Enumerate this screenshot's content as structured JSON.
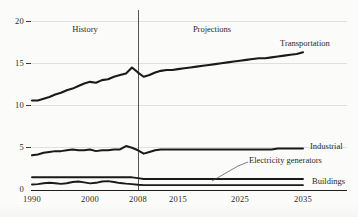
{
  "chart_data": {
    "type": "line",
    "title": "",
    "xlabel": "",
    "ylabel": "",
    "xlim": [
      1990,
      2035
    ],
    "ylim": [
      0,
      20
    ],
    "grid": true,
    "legend_position": "right-inline",
    "y_ticks": [
      "0",
      "5",
      "10",
      "15",
      "20"
    ],
    "y_tick_values": [
      0,
      5,
      10,
      15,
      20
    ],
    "x_ticks": [
      "1990",
      "2000",
      "2008",
      "2015",
      "2025",
      "2035"
    ],
    "x_tick_values": [
      1990,
      2000,
      2008,
      2015,
      2025,
      2035
    ],
    "annotations": [
      {
        "text": "History",
        "x": 1999,
        "y": 18.6
      },
      {
        "text": "Projections",
        "x": 2019,
        "y": 18.6
      }
    ],
    "divider": {
      "x": 2008,
      "label": "history-projection-divider"
    },
    "series": [
      {
        "name": "Transportation",
        "x": [
          1990,
          1991,
          1992,
          1993,
          1994,
          1995,
          1996,
          1997,
          1998,
          1999,
          2000,
          2001,
          2002,
          2003,
          2004,
          2005,
          2006,
          2007,
          2008,
          2009,
          2010,
          2011,
          2012,
          2013,
          2014,
          2015,
          2016,
          2017,
          2018,
          2019,
          2020,
          2021,
          2022,
          2023,
          2024,
          2025,
          2026,
          2027,
          2028,
          2029,
          2030,
          2031,
          2032,
          2033,
          2034,
          2035
        ],
        "values": [
          10.6,
          10.6,
          10.8,
          11.0,
          11.3,
          11.5,
          11.8,
          12.0,
          12.3,
          12.6,
          12.8,
          12.7,
          13.0,
          13.1,
          13.4,
          13.6,
          13.8,
          14.5,
          13.9,
          13.4,
          13.6,
          13.9,
          14.1,
          14.2,
          14.2,
          14.3,
          14.4,
          14.5,
          14.6,
          14.7,
          14.8,
          14.9,
          15.0,
          15.1,
          15.2,
          15.3,
          15.4,
          15.5,
          15.6,
          15.6,
          15.7,
          15.8,
          15.9,
          16.0,
          16.1,
          16.3
        ]
      },
      {
        "name": "Industrial",
        "x": [
          1990,
          1991,
          1992,
          1993,
          1994,
          1995,
          1996,
          1997,
          1998,
          1999,
          2000,
          2001,
          2002,
          2003,
          2004,
          2005,
          2006,
          2007,
          2008,
          2009,
          2010,
          2011,
          2012,
          2013,
          2014,
          2015,
          2016,
          2017,
          2018,
          2019,
          2020,
          2021,
          2022,
          2023,
          2024,
          2025,
          2026,
          2027,
          2028,
          2029,
          2030,
          2031,
          2032,
          2033,
          2034,
          2035
        ],
        "values": [
          4.1,
          4.2,
          4.4,
          4.5,
          4.6,
          4.6,
          4.7,
          4.8,
          4.7,
          4.7,
          4.8,
          4.6,
          4.7,
          4.7,
          4.8,
          4.8,
          5.2,
          5.0,
          4.7,
          4.3,
          4.5,
          4.7,
          4.8,
          4.8,
          4.8,
          4.8,
          4.8,
          4.8,
          4.8,
          4.8,
          4.8,
          4.8,
          4.8,
          4.8,
          4.8,
          4.8,
          4.8,
          4.8,
          4.8,
          4.8,
          4.8,
          4.9,
          4.9,
          4.9,
          4.9,
          4.9
        ]
      },
      {
        "name": "Electricity generators",
        "x": [
          1990,
          1991,
          1992,
          1993,
          1994,
          1995,
          1996,
          1997,
          1998,
          1999,
          2000,
          2001,
          2002,
          2003,
          2004,
          2005,
          2006,
          2007,
          2008,
          2009,
          2010,
          2011,
          2012,
          2013,
          2014,
          2015,
          2016,
          2017,
          2018,
          2019,
          2020,
          2021,
          2022,
          2023,
          2024,
          2025,
          2026,
          2027,
          2028,
          2029,
          2030,
          2031,
          2032,
          2033,
          2034,
          2035
        ],
        "values": [
          1.5,
          1.5,
          1.5,
          1.5,
          1.5,
          1.5,
          1.5,
          1.5,
          1.5,
          1.5,
          1.5,
          1.5,
          1.5,
          1.5,
          1.5,
          1.5,
          1.5,
          1.5,
          1.4,
          1.3,
          1.3,
          1.3,
          1.3,
          1.3,
          1.3,
          1.3,
          1.3,
          1.3,
          1.3,
          1.3,
          1.3,
          1.3,
          1.3,
          1.3,
          1.3,
          1.3,
          1.3,
          1.3,
          1.3,
          1.3,
          1.3,
          1.3,
          1.3,
          1.3,
          1.3,
          1.3
        ]
      },
      {
        "name": "Buildings",
        "x": [
          1990,
          1991,
          1992,
          1993,
          1994,
          1995,
          1996,
          1997,
          1998,
          1999,
          2000,
          2001,
          2002,
          2003,
          2004,
          2005,
          2006,
          2007,
          2008,
          2009,
          2010,
          2011,
          2012,
          2013,
          2014,
          2015,
          2016,
          2017,
          2018,
          2019,
          2020,
          2021,
          2022,
          2023,
          2024,
          2025,
          2026,
          2027,
          2028,
          2029,
          2030,
          2031,
          2032,
          2033,
          2034,
          2035
        ],
        "values": [
          0.65,
          0.7,
          0.8,
          0.85,
          0.8,
          0.72,
          0.8,
          0.95,
          1.0,
          0.9,
          0.78,
          0.85,
          1.0,
          1.05,
          0.95,
          0.82,
          0.75,
          0.7,
          0.62,
          0.58,
          0.58,
          0.58,
          0.58,
          0.58,
          0.58,
          0.58,
          0.58,
          0.58,
          0.58,
          0.58,
          0.58,
          0.58,
          0.58,
          0.58,
          0.58,
          0.58,
          0.58,
          0.58,
          0.58,
          0.58,
          0.58,
          0.58,
          0.58,
          0.58,
          0.58,
          0.58
        ]
      }
    ],
    "series_labels": [
      {
        "name": "Transportation",
        "label": "Transportation"
      },
      {
        "name": "Industrial",
        "label": "Industrial"
      },
      {
        "name": "Electricity generators",
        "label": "Electricity generators"
      },
      {
        "name": "Buildings",
        "label": "Buildings"
      }
    ],
    "colors": {
      "line": "#1a1a1a",
      "axis": "#1f1f1f",
      "grid": "#e2e2de",
      "divider": "#555555",
      "text": "#2a2a2a",
      "background": "#fdfdfc"
    }
  },
  "axes": {
    "y_labels": [
      "20",
      "15",
      "10",
      "5",
      "0"
    ],
    "x_labels": [
      "1990",
      "2000",
      "2008",
      "2015",
      "2025",
      "2035"
    ]
  },
  "labels": {
    "history": "History",
    "projections": "Projections",
    "transportation": "Transportation",
    "industrial": "Industrial",
    "electricity_generators": "Electricity generators",
    "buildings": "Buildings"
  }
}
